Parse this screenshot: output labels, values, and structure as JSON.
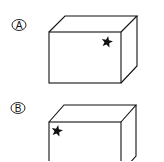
{
  "options": [
    {
      "label": "A",
      "label_center": [
        19,
        25
      ],
      "cube": {
        "front": {
          "x1": 49,
          "y1": 32,
          "x2": 121,
          "y2": 83
        },
        "depth_dx": 16,
        "depth_dy": -16
      },
      "star": {
        "cx": 107,
        "cy": 42,
        "r": 6,
        "position": "top-right of front face"
      }
    },
    {
      "label": "B",
      "label_center": [
        18,
        108
      ],
      "cube": {
        "front": {
          "x1": 49,
          "y1": 122,
          "x2": 121,
          "y2": 173
        },
        "depth_dx": 15,
        "depth_dy": -17
      },
      "star": {
        "cx": 57,
        "cy": 131,
        "r": 6,
        "position": "top-left of front face"
      }
    }
  ],
  "colors": {
    "stroke": "#111111",
    "star": "#111111",
    "background": "#ffffff"
  }
}
